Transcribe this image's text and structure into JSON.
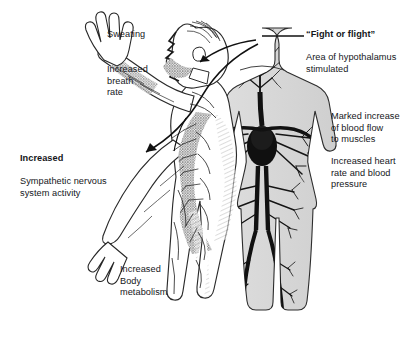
{
  "diagram": {
    "background_color": "#ffffff",
    "ink_color": "#15161a",
    "figures": [
      {
        "name": "left-figure",
        "description": "Side-view male human figure with sympathetic nervous system shaded, one arm raised"
      },
      {
        "name": "right-figure",
        "description": "Front-view male human figure showing circulatory system, heart and branching blood vessels"
      }
    ],
    "labels": [
      {
        "id": "sweating",
        "text": "Sweating",
        "bold_lead": ""
      },
      {
        "id": "breath",
        "text": "Increased\nbreath\nrate",
        "bold_lead": ""
      },
      {
        "id": "sympathetic",
        "text": "Sympathetic nervous\nsystem activity",
        "bold_lead": "Increased"
      },
      {
        "id": "metabolism",
        "text": "Increased\nBody\nmetabolism",
        "bold_lead": ""
      },
      {
        "id": "fight",
        "text": "Area of hypothalamus\nstimulated",
        "bold_lead": "“Fight or flight”"
      },
      {
        "id": "bloodflow",
        "text": "Marked increase\nof blood flow\nto muscles",
        "bold_lead": ""
      },
      {
        "id": "heart",
        "text": "Increased heart\nrate and blood\npressure",
        "bold_lead": ""
      }
    ],
    "leader_lines": [
      {
        "id": "hypothalamus-leader",
        "from": "right-figure-head",
        "to": "fight-or-flight-label"
      },
      {
        "id": "head-arrow",
        "from": "right-figure-head",
        "to": "left-figure-head"
      },
      {
        "id": "arm-arrow",
        "from": "right-figure-head",
        "to": "left-figure-forearm"
      }
    ]
  }
}
